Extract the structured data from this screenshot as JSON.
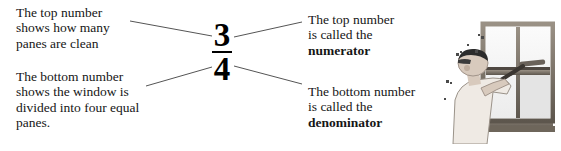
{
  "diagram": {
    "fraction": {
      "numerator": "3",
      "denominator": "4",
      "spoken": "three fourths"
    },
    "callouts": {
      "top_left": {
        "lines": [
          "The top number",
          "shows how many",
          "panes are clean"
        ]
      },
      "bottom_left": {
        "lines": [
          "The bottom number",
          "shows the window is",
          "divided into four equal",
          "panes."
        ]
      },
      "top_right": {
        "lines": [
          "The top number",
          "is called the"
        ],
        "term": "numerator"
      },
      "bottom_right": {
        "lines": [
          "The bottom number",
          "is called the"
        ],
        "term": "denominator"
      }
    },
    "illustration": {
      "name": "person-cleaning-window-illustration",
      "description": "A person wearing a cap uses a squeegee to clean a four-pane window",
      "panes": 4
    },
    "colors": {
      "background": "#ffffff",
      "text": "#161616",
      "fraction": "#000000",
      "leader_line": "#555555",
      "frame_dark": "#5d564d",
      "frame_mid": "#8b8378",
      "glass": "#f2f2f2",
      "skin": "#cdbfb3",
      "shirt": "#efeae4",
      "hair": "#2b2b2b"
    }
  }
}
